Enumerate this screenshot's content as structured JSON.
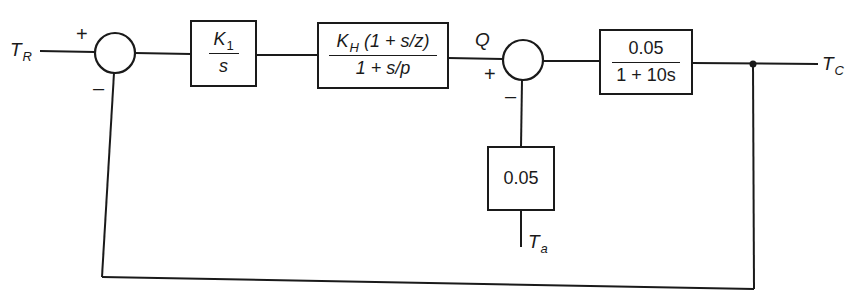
{
  "diagram": {
    "type": "control-system-block-diagram",
    "signals": {
      "reference": {
        "symbol": "T",
        "subscript": "R"
      },
      "output": {
        "symbol": "T",
        "subscript": "C"
      },
      "disturbance": {
        "symbol": "T",
        "subscript": "a"
      },
      "intermediate": "Q"
    },
    "summing_junctions": [
      {
        "id": "sum1",
        "plus_sign": "+",
        "minus_sign": "–"
      },
      {
        "id": "sum2",
        "plus_sign": "+",
        "minus_sign": "–"
      }
    ],
    "blocks": {
      "integrator": {
        "num_symbol": "K",
        "num_subscript": "1",
        "den": "s"
      },
      "compensator": {
        "num_symbol": "K",
        "num_subscript": "H",
        "num_rest": "(1 + s/z)",
        "den": "1 + s/p"
      },
      "plant": {
        "num": "0.05",
        "den": "1 + 10s"
      },
      "disturbance_gain": {
        "value": "0.05"
      }
    },
    "colors": {
      "line": "#1a1a1a",
      "background": "#ffffff"
    }
  }
}
